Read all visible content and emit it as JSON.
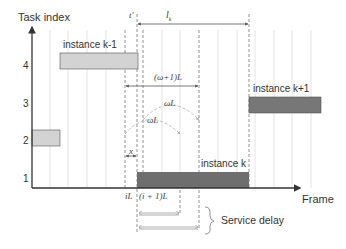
{
  "axes": {
    "y_label": "Task index",
    "x_label": "Frame",
    "y_ticks": [
      "4",
      "3",
      "2",
      "1"
    ]
  },
  "instances": [
    {
      "label": "instance k-1",
      "task": 4,
      "color": "#d3d3d3"
    },
    {
      "label": "instance k+1",
      "task": 3,
      "color": "#777777"
    },
    {
      "label": "instance k",
      "task": 1,
      "color": "#6e6e6e"
    },
    {
      "label": "",
      "task": 2,
      "color": "#d3d3d3"
    }
  ],
  "annotations": {
    "t_prime": "t'",
    "l_k": "l",
    "l_k_sub": "k",
    "omega_plus_1_L": "(ω+1)L",
    "omega_L_upper": "ωL",
    "omega_L_lower": "ωL",
    "x": "x",
    "iL": "iL",
    "i_plus_1_L": "(i + 1)L",
    "service_delay": "Service delay"
  },
  "colors": {
    "axis": "#333333",
    "grid": "#e3e3e3",
    "dashed": "#777777",
    "light_bar": "#d3d3d3",
    "dark_bar": "#6e6e6e"
  }
}
